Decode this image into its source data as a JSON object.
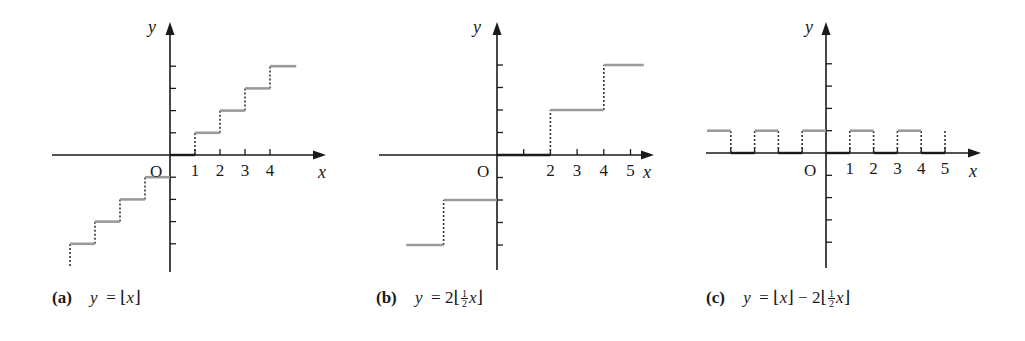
{
  "colors": {
    "axis": "#1a1a1a",
    "step": "#9a9a9a",
    "dashed": "#333333",
    "background": "#ffffff"
  },
  "chart_data": [
    {
      "id": "a",
      "type": "line",
      "subtype": "step",
      "title": "y = ⌊x⌋",
      "caption": {
        "tag": "(a)",
        "lhs": "y",
        "rhs_parts": [
          "⌊",
          "x",
          "⌋"
        ]
      },
      "xlabel": "x",
      "ylabel": "y",
      "origin_label": "O",
      "xtick_labels": [
        "1",
        "2",
        "3",
        "4"
      ],
      "xticks": [
        1,
        2,
        3,
        4
      ],
      "yticks": [
        -4,
        -3,
        -2,
        -1,
        1,
        2,
        3,
        4
      ],
      "xlim": [
        -4.8,
        6.2
      ],
      "ylim": [
        -5.2,
        6.0
      ],
      "grid": false,
      "segments": [
        {
          "x0": -4.0,
          "x1": -3,
          "y": -4
        },
        {
          "x0": -3,
          "x1": -2,
          "y": -3
        },
        {
          "x0": -2,
          "x1": -1,
          "y": -2
        },
        {
          "x0": -1,
          "x1": 0,
          "y": -1
        },
        {
          "x0": 0,
          "x1": 1,
          "y": 0
        },
        {
          "x0": 1,
          "x1": 2,
          "y": 1
        },
        {
          "x0": 2,
          "x1": 3,
          "y": 2
        },
        {
          "x0": 3,
          "x1": 4,
          "y": 3
        },
        {
          "x0": 4,
          "x1": 5.05,
          "y": 4
        }
      ],
      "jumps": [
        {
          "x": -4,
          "y0": -5.0,
          "y1": -4
        },
        {
          "x": -3,
          "y0": -4,
          "y1": -3
        },
        {
          "x": -2,
          "y0": -3,
          "y1": -2
        },
        {
          "x": -1,
          "y0": -2,
          "y1": -1
        },
        {
          "x": 1,
          "y0": 0,
          "y1": 1
        },
        {
          "x": 2,
          "y0": 1,
          "y1": 2
        },
        {
          "x": 3,
          "y0": 2,
          "y1": 3
        },
        {
          "x": 4,
          "y0": 3,
          "y1": 4
        }
      ]
    },
    {
      "id": "b",
      "type": "line",
      "subtype": "step",
      "title": "y = 2⌊x/2⌋",
      "caption": {
        "tag": "(b)",
        "lhs": "y",
        "coef": "2",
        "frac_num": "1",
        "frac_den": "2",
        "var": "x"
      },
      "xlabel": "x",
      "ylabel": "y",
      "origin_label": "O",
      "xtick_labels": [
        "2",
        "3",
        "4",
        "5"
      ],
      "xticks": [
        1,
        2,
        3,
        4,
        5
      ],
      "yticks": [
        -4,
        -3,
        -2,
        -1,
        1,
        2,
        3,
        4
      ],
      "xlim": [
        -3.4,
        5.9
      ],
      "ylim": [
        -5.2,
        6.0
      ],
      "grid": false,
      "segments": [
        {
          "x0": -3.4,
          "x1": -2,
          "y": -4
        },
        {
          "x0": -2,
          "x1": 0,
          "y": -2
        },
        {
          "x0": 0,
          "x1": 2,
          "y": 0
        },
        {
          "x0": 2,
          "x1": 4,
          "y": 2
        },
        {
          "x0": 4,
          "x1": 5.5,
          "y": 4
        }
      ],
      "jumps": [
        {
          "x": -2,
          "y0": -4,
          "y1": -2
        },
        {
          "x": 2,
          "y0": 0,
          "y1": 2
        },
        {
          "x": 4,
          "y0": 2,
          "y1": 4
        }
      ]
    },
    {
      "id": "c",
      "type": "line",
      "subtype": "step",
      "title": "y = ⌊x⌋ − 2⌊x/2⌋",
      "caption": {
        "tag": "(c)",
        "lhs": "y",
        "coef": "2",
        "frac_num": "1",
        "frac_den": "2",
        "var": "x"
      },
      "xlabel": "x",
      "ylabel": "y",
      "origin_label": "O",
      "xtick_labels": [
        "1",
        "2",
        "3",
        "4",
        "5"
      ],
      "xticks": [
        -4,
        -3,
        -2,
        -1,
        1,
        2,
        3,
        4,
        5
      ],
      "yticks": [
        -4,
        -3,
        -2,
        -1,
        1,
        2,
        3,
        4
      ],
      "xlim": [
        -5.0,
        6.5
      ],
      "ylim": [
        -5.2,
        6.0
      ],
      "grid": false,
      "segments": [
        {
          "x0": -5.0,
          "x1": -4,
          "y": 1
        },
        {
          "x0": -4,
          "x1": -3,
          "y": 0
        },
        {
          "x0": -3,
          "x1": -2,
          "y": 1
        },
        {
          "x0": -2,
          "x1": -1,
          "y": 0
        },
        {
          "x0": -1,
          "x1": 0,
          "y": 1
        },
        {
          "x0": 0,
          "x1": 1,
          "y": 0
        },
        {
          "x0": 1,
          "x1": 2,
          "y": 1
        },
        {
          "x0": 2,
          "x1": 3,
          "y": 0
        },
        {
          "x0": 3,
          "x1": 4,
          "y": 1
        },
        {
          "x0": 4,
          "x1": 5,
          "y": 0
        }
      ],
      "jumps": [
        {
          "x": -4,
          "y0": 0,
          "y1": 1
        },
        {
          "x": -3,
          "y0": 0,
          "y1": 1
        },
        {
          "x": -2,
          "y0": 0,
          "y1": 1
        },
        {
          "x": -1,
          "y0": 0,
          "y1": 1
        },
        {
          "x": 1,
          "y0": 0,
          "y1": 1
        },
        {
          "x": 2,
          "y0": 0,
          "y1": 1
        },
        {
          "x": 3,
          "y0": 0,
          "y1": 1
        },
        {
          "x": 4,
          "y0": 0,
          "y1": 1
        },
        {
          "x": 5,
          "y0": 0,
          "y1": 1
        }
      ]
    }
  ],
  "layout": {
    "panels": [
      {
        "ox": 170,
        "oy": 155,
        "ux": 25,
        "uy": 22.2,
        "axis_left": 52,
        "axis_right": 326,
        "axis_top": 22,
        "axis_bottom": 272,
        "caption_x": 52,
        "caption_y": 288,
        "ylabel_x": 148,
        "ylabel_y": 33,
        "xlabel_x": 318,
        "xlabel_y": 178,
        "olabel_x": 150,
        "olabel_y": 177
      },
      {
        "ox": 497,
        "oy": 155,
        "ux": 26.7,
        "uy": 22.5,
        "axis_left": 379,
        "axis_right": 654,
        "axis_top": 22,
        "axis_bottom": 270,
        "caption_x": 376,
        "caption_y": 288,
        "ylabel_x": 473,
        "ylabel_y": 33,
        "xlabel_x": 643,
        "xlabel_y": 178,
        "olabel_x": 477,
        "olabel_y": 177
      },
      {
        "ox": 826,
        "oy": 153,
        "ux": 23.8,
        "uy": 22.3,
        "axis_left": 706,
        "axis_right": 981,
        "axis_top": 22,
        "axis_bottom": 268,
        "caption_x": 706,
        "caption_y": 288,
        "ylabel_x": 805,
        "ylabel_y": 33,
        "xlabel_x": 969,
        "xlabel_y": 177,
        "olabel_x": 804,
        "olabel_y": 176
      }
    ]
  }
}
